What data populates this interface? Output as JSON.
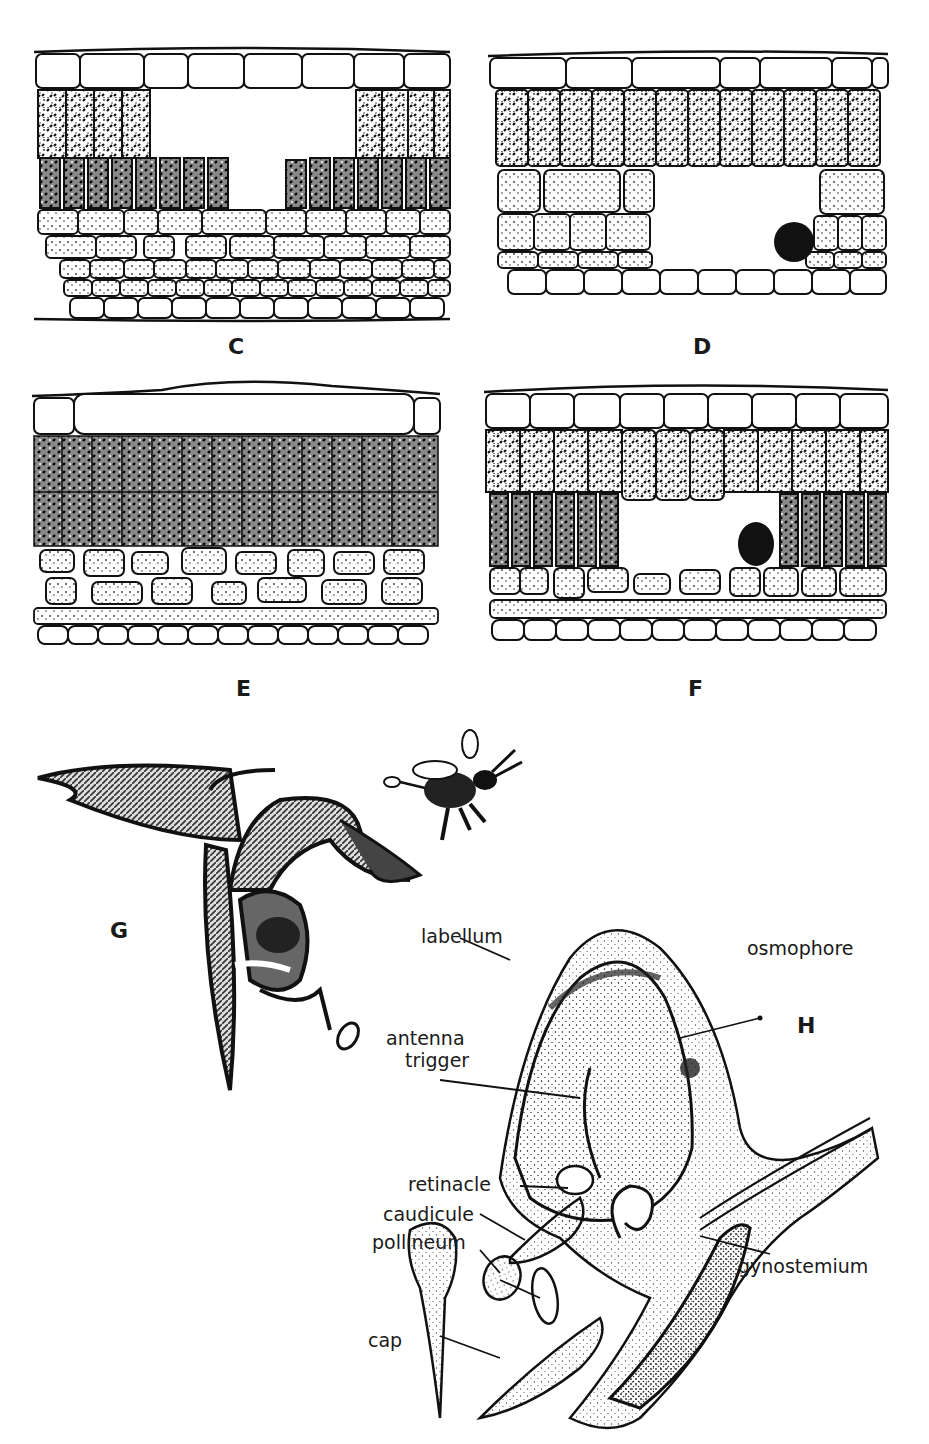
{
  "figure": {
    "header_fragment": "",
    "panels": [
      {
        "id": "C",
        "label": "C",
        "type": "leaf-cross-section",
        "feature": "large cavity in palisade layer"
      },
      {
        "id": "D",
        "label": "D",
        "type": "leaf-cross-section",
        "feature": "cavity in spongy mesophyll with dark body"
      },
      {
        "id": "E",
        "label": "E",
        "type": "leaf-cross-section",
        "feature": "intact leaf tissue"
      },
      {
        "id": "F",
        "label": "F",
        "type": "leaf-cross-section",
        "feature": "cavity in palisade with dark body"
      },
      {
        "id": "G",
        "label": "G",
        "type": "orchid-flower-with-bee"
      },
      {
        "id": "H",
        "label": "H",
        "type": "orchid-flower-cross-section"
      }
    ],
    "callouts": {
      "labellum": "labellum",
      "osmophore": "osmophore",
      "antenna_trigger_1": "antenna",
      "antenna_trigger_2": "trigger",
      "retinacle": "retinacle",
      "caudicule": "caudicule",
      "pollineum": "pollineum",
      "gynostemium": "gynostemium",
      "cap": "cap"
    },
    "colors": {
      "ink": "#1a1a1a",
      "stipple": "#555555",
      "background": "#ffffff"
    }
  }
}
